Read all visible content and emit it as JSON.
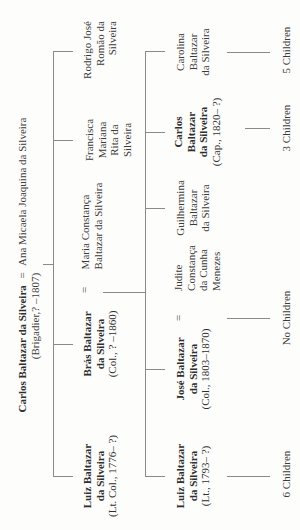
{
  "gen1": {
    "husband_name": "Carlos Baltazar da Silveira",
    "spouse_sign": "=",
    "wife_name": "Ana Micaela Joaquina da Silveira",
    "husband_detail": "(Brigadier,? –1807)"
  },
  "gen2": [
    {
      "lines": [
        "Luiz Baltazar",
        "da Silveira"
      ],
      "detail": "(Lt. Col., 1776– ?)",
      "bold": true
    },
    {
      "lines": [
        "Brás Baltazar",
        "da Silveira"
      ],
      "detail": "(Col., ? –1860)",
      "bold": true,
      "spouse_sign": "=",
      "spouse_lines": [
        "Maria Constança",
        "Baltazar da Silveira"
      ]
    },
    {
      "lines": [
        "Francisca",
        "Mariana",
        "Rita da",
        "Silveira"
      ],
      "bold": false
    },
    {
      "lines": [
        "Rodrigo José",
        "Romão da",
        "Silveira"
      ],
      "bold": false
    }
  ],
  "gen3": [
    {
      "lines": [
        "Luiz Baltazar",
        "da Silveira"
      ],
      "detail": "(Lt., 1793– ?)",
      "bold": true,
      "children": "6 Children"
    },
    {
      "lines": [
        "José Baltazar",
        "da Silveira"
      ],
      "detail": "(Col., 1803–1870)",
      "bold": true,
      "spouse_sign": "=",
      "spouse_lines": [
        "Judite",
        "Constança",
        "da Cunha",
        "Menezes"
      ],
      "children": "No Children"
    },
    {
      "lines": [
        "Guilhermina",
        "Baltazar",
        "da Silveira"
      ],
      "bold": false
    },
    {
      "lines": [
        "Carlos",
        "Baltazar",
        "da Silveira"
      ],
      "detail": "(Cap., 1820– ?)",
      "bold": true,
      "children": "3 Children"
    },
    {
      "lines": [
        "Carolina",
        "Baltazar",
        "da Silveira"
      ],
      "bold": false,
      "children": "5 Children"
    }
  ],
  "colors": {
    "line": "#8a8a8a",
    "text": "#3a3a3a",
    "background": "#fdfdfb"
  }
}
